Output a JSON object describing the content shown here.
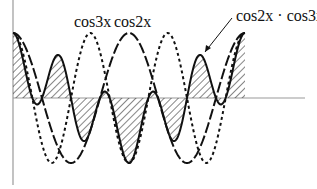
{
  "diagram": {
    "labels": {
      "cos3x": "cos3x",
      "cos2x": "cos2x",
      "product": "cos2x · cos3x",
      "bottom_cut": "2x"
    },
    "curves": [
      {
        "name": "cos2x",
        "style": "long-dash"
      },
      {
        "name": "cos3x",
        "style": "dotted"
      },
      {
        "name": "cos2x · cos3x",
        "style": "solid, hatched area"
      }
    ],
    "domain": "0 to 2π",
    "colors": {
      "ink": "#111111",
      "axis": "#9a9a9a",
      "background": "#ffffff"
    }
  }
}
